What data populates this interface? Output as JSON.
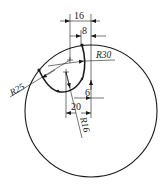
{
  "drawing": {
    "type": "engineering-drawing",
    "dimensions": {
      "width_16": "16",
      "width_8": "8",
      "radius_30": "R30",
      "radius_25": "R25",
      "radius_16": "R16",
      "offset_6": "6",
      "offset_20": "20"
    },
    "colors": {
      "line": "#1a1a1a",
      "background": "#ffffff"
    }
  }
}
